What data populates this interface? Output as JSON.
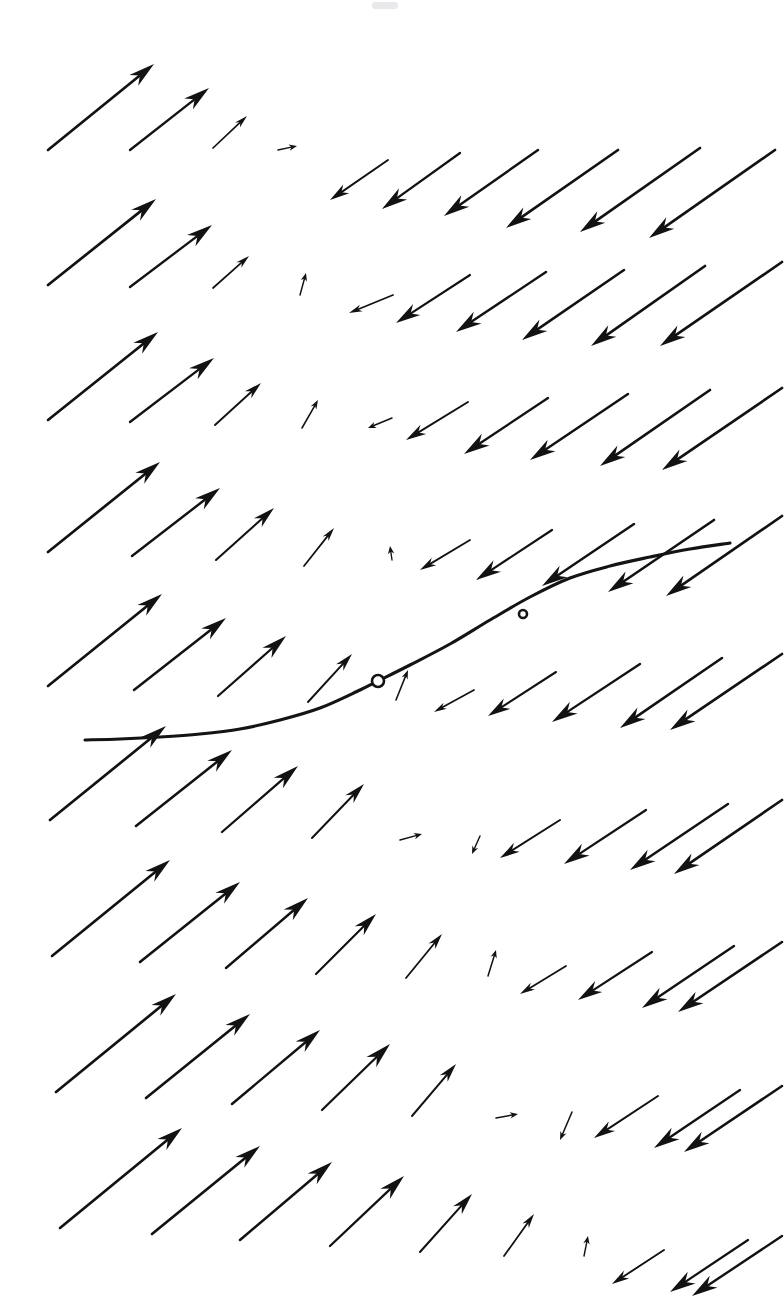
{
  "figure": {
    "kind": "direction-field-plot",
    "title": "",
    "background_color": "#ffffff",
    "ink_color": "#121212",
    "width": 784,
    "height": 1310
  },
  "chart_data": {
    "type": "scatter",
    "title": "",
    "subtitle": "",
    "xlabel": "",
    "ylabel": "",
    "grid": false,
    "legend": null,
    "axis_ticks_shown": false,
    "pixel_domain": {
      "x": [
        0,
        784
      ],
      "y": [
        0,
        1310
      ]
    },
    "vector_grid": {
      "columns_x": [
        48,
        118,
        188,
        258,
        328,
        398,
        468,
        538,
        608,
        678,
        748
      ],
      "rows_y": [
        150,
        222,
        294,
        366,
        438,
        510,
        582,
        654,
        726,
        798,
        870,
        942,
        1014,
        1086,
        1158,
        1230
      ],
      "nullcline_note": "Arrow magnitude shrinks to near zero along a diagonal band running from upper-middle-left toward lower-right; arrows reverse direction across that band.",
      "left_region_direction": "up-and-right (northeast)",
      "right_region_direction": "down-and-left (southwest)"
    },
    "vectors": [
      {
        "x": 48,
        "y": 150,
        "dx": 106,
        "dy": -86
      },
      {
        "x": 130,
        "y": 150,
        "dx": 79,
        "dy": -62
      },
      {
        "x": 213,
        "y": 148,
        "dx": 34,
        "dy": -32
      },
      {
        "x": 278,
        "y": 150,
        "dx": 19,
        "dy": -4
      },
      {
        "x": 388,
        "y": 160,
        "dx": -58,
        "dy": 40
      },
      {
        "x": 460,
        "y": 153,
        "dx": -78,
        "dy": 56
      },
      {
        "x": 538,
        "y": 150,
        "dx": -94,
        "dy": 66
      },
      {
        "x": 618,
        "y": 150,
        "dx": -112,
        "dy": 78
      },
      {
        "x": 700,
        "y": 148,
        "dx": -120,
        "dy": 84
      },
      {
        "x": 775,
        "y": 150,
        "dx": -126,
        "dy": 88
      },
      {
        "x": 48,
        "y": 285,
        "dx": 108,
        "dy": -86
      },
      {
        "x": 130,
        "y": 287,
        "dx": 82,
        "dy": -62
      },
      {
        "x": 213,
        "y": 288,
        "dx": 36,
        "dy": -32
      },
      {
        "x": 300,
        "y": 295,
        "dx": 6,
        "dy": -22
      },
      {
        "x": 393,
        "y": 295,
        "dx": -44,
        "dy": 18
      },
      {
        "x": 470,
        "y": 275,
        "dx": -74,
        "dy": 48
      },
      {
        "x": 546,
        "y": 272,
        "dx": -90,
        "dy": 60
      },
      {
        "x": 624,
        "y": 270,
        "dx": -102,
        "dy": 70
      },
      {
        "x": 705,
        "y": 266,
        "dx": -114,
        "dy": 80
      },
      {
        "x": 782,
        "y": 262,
        "dx": -122,
        "dy": 84
      },
      {
        "x": 48,
        "y": 420,
        "dx": 110,
        "dy": -88
      },
      {
        "x": 130,
        "y": 422,
        "dx": 84,
        "dy": -64
      },
      {
        "x": 215,
        "y": 425,
        "dx": 46,
        "dy": -42
      },
      {
        "x": 302,
        "y": 428,
        "dx": 16,
        "dy": -28
      },
      {
        "x": 392,
        "y": 418,
        "dx": -24,
        "dy": 10
      },
      {
        "x": 468,
        "y": 402,
        "dx": -62,
        "dy": 38
      },
      {
        "x": 548,
        "y": 398,
        "dx": -84,
        "dy": 56
      },
      {
        "x": 628,
        "y": 394,
        "dx": -98,
        "dy": 66
      },
      {
        "x": 710,
        "y": 390,
        "dx": -110,
        "dy": 76
      },
      {
        "x": 782,
        "y": 388,
        "dx": -120,
        "dy": 82
      },
      {
        "x": 48,
        "y": 552,
        "dx": 112,
        "dy": -90
      },
      {
        "x": 132,
        "y": 556,
        "dx": 88,
        "dy": -68
      },
      {
        "x": 216,
        "y": 560,
        "dx": 58,
        "dy": -52
      },
      {
        "x": 304,
        "y": 566,
        "dx": 30,
        "dy": -38
      },
      {
        "x": 392,
        "y": 560,
        "dx": -2,
        "dy": -14
      },
      {
        "x": 470,
        "y": 540,
        "dx": -50,
        "dy": 30
      },
      {
        "x": 552,
        "y": 530,
        "dx": -76,
        "dy": 50
      },
      {
        "x": 634,
        "y": 524,
        "dx": -92,
        "dy": 62
      },
      {
        "x": 714,
        "y": 520,
        "dx": -106,
        "dy": 72
      },
      {
        "x": 782,
        "y": 516,
        "dx": -116,
        "dy": 80
      },
      {
        "x": 48,
        "y": 686,
        "dx": 114,
        "dy": -92
      },
      {
        "x": 134,
        "y": 690,
        "dx": 92,
        "dy": -72
      },
      {
        "x": 218,
        "y": 696,
        "dx": 68,
        "dy": -60
      },
      {
        "x": 308,
        "y": 702,
        "dx": 44,
        "dy": -48
      },
      {
        "x": 396,
        "y": 700,
        "dx": 12,
        "dy": -30
      },
      {
        "x": 474,
        "y": 690,
        "dx": -40,
        "dy": 22
      },
      {
        "x": 556,
        "y": 672,
        "dx": -68,
        "dy": 44
      },
      {
        "x": 640,
        "y": 664,
        "dx": -88,
        "dy": 58
      },
      {
        "x": 722,
        "y": 658,
        "dx": -102,
        "dy": 70
      },
      {
        "x": 782,
        "y": 654,
        "dx": -112,
        "dy": 76
      },
      {
        "x": 50,
        "y": 820,
        "dx": 116,
        "dy": -94
      },
      {
        "x": 136,
        "y": 826,
        "dx": 96,
        "dy": -76
      },
      {
        "x": 222,
        "y": 832,
        "dx": 76,
        "dy": -66
      },
      {
        "x": 312,
        "y": 838,
        "dx": 52,
        "dy": -54
      },
      {
        "x": 400,
        "y": 840,
        "dx": 22,
        "dy": -6
      },
      {
        "x": 480,
        "y": 836,
        "dx": -8,
        "dy": 18
      },
      {
        "x": 560,
        "y": 820,
        "dx": -60,
        "dy": 38
      },
      {
        "x": 646,
        "y": 810,
        "dx": -82,
        "dy": 54
      },
      {
        "x": 728,
        "y": 804,
        "dx": -98,
        "dy": 66
      },
      {
        "x": 782,
        "y": 800,
        "dx": -108,
        "dy": 74
      },
      {
        "x": 52,
        "y": 956,
        "dx": 118,
        "dy": -96
      },
      {
        "x": 140,
        "y": 962,
        "dx": 100,
        "dy": -80
      },
      {
        "x": 226,
        "y": 968,
        "dx": 82,
        "dy": -70
      },
      {
        "x": 316,
        "y": 974,
        "dx": 60,
        "dy": -60
      },
      {
        "x": 406,
        "y": 978,
        "dx": 36,
        "dy": -44
      },
      {
        "x": 488,
        "y": 976,
        "dx": 8,
        "dy": -26
      },
      {
        "x": 566,
        "y": 966,
        "dx": -46,
        "dy": 28
      },
      {
        "x": 652,
        "y": 952,
        "dx": -74,
        "dy": 48
      },
      {
        "x": 734,
        "y": 946,
        "dx": -92,
        "dy": 62
      },
      {
        "x": 782,
        "y": 942,
        "dx": -104,
        "dy": 70
      },
      {
        "x": 56,
        "y": 1092,
        "dx": 120,
        "dy": -98
      },
      {
        "x": 146,
        "y": 1098,
        "dx": 104,
        "dy": -84
      },
      {
        "x": 232,
        "y": 1104,
        "dx": 88,
        "dy": -74
      },
      {
        "x": 322,
        "y": 1110,
        "dx": 68,
        "dy": -66
      },
      {
        "x": 412,
        "y": 1116,
        "dx": 44,
        "dy": -52
      },
      {
        "x": 496,
        "y": 1118,
        "dx": 22,
        "dy": -4
      },
      {
        "x": 572,
        "y": 1112,
        "dx": -12,
        "dy": 28
      },
      {
        "x": 658,
        "y": 1096,
        "dx": -64,
        "dy": 42
      },
      {
        "x": 740,
        "y": 1090,
        "dx": -86,
        "dy": 58
      },
      {
        "x": 782,
        "y": 1086,
        "dx": -98,
        "dy": 66
      },
      {
        "x": 60,
        "y": 1228,
        "dx": 122,
        "dy": -100
      },
      {
        "x": 152,
        "y": 1234,
        "dx": 108,
        "dy": -88
      },
      {
        "x": 240,
        "y": 1240,
        "dx": 92,
        "dy": -78
      },
      {
        "x": 330,
        "y": 1246,
        "dx": 74,
        "dy": -70
      },
      {
        "x": 420,
        "y": 1252,
        "dx": 52,
        "dy": -58
      },
      {
        "x": 504,
        "y": 1256,
        "dx": 30,
        "dy": -42
      },
      {
        "x": 584,
        "y": 1256,
        "dx": 4,
        "dy": -20
      },
      {
        "x": 664,
        "y": 1250,
        "dx": -52,
        "dy": 34
      },
      {
        "x": 748,
        "y": 1240,
        "dx": -78,
        "dy": 52
      },
      {
        "x": 782,
        "y": 1236,
        "dx": -90,
        "dy": 60
      }
    ],
    "solution_curve": {
      "label": "",
      "stroke_color": "#141414",
      "points": [
        [
          85,
          740
        ],
        [
          120,
          739
        ],
        [
          160,
          737
        ],
        [
          200,
          734
        ],
        [
          240,
          729
        ],
        [
          280,
          720
        ],
        [
          320,
          708
        ],
        [
          360,
          690
        ],
        [
          378,
          681
        ],
        [
          410,
          665
        ],
        [
          450,
          644
        ],
        [
          490,
          620
        ],
        [
          530,
          597
        ],
        [
          570,
          578
        ],
        [
          610,
          566
        ],
        [
          650,
          557
        ],
        [
          690,
          549
        ],
        [
          730,
          543
        ]
      ]
    },
    "markers": [
      {
        "name": "initial-condition",
        "x": 378,
        "y": 681,
        "radius": 6,
        "style": "open-circle"
      },
      {
        "name": "secondary-point",
        "x": 523,
        "y": 614,
        "radius": 4,
        "style": "open-circle"
      }
    ],
    "annotations": []
  }
}
